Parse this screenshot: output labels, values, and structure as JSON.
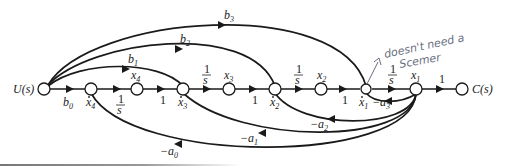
{
  "figure": {
    "type": "signal-flow-graph",
    "input_label": "U(s)",
    "output_label": "C(s)",
    "nodes": [
      {
        "id": "U",
        "label": "U(s)"
      },
      {
        "id": "x4dot",
        "label": "ẋ4"
      },
      {
        "id": "x4",
        "label": "x4"
      },
      {
        "id": "x3dot",
        "label": "ẋ3"
      },
      {
        "id": "x3",
        "label": "x3"
      },
      {
        "id": "x2dot",
        "label": "ẋ2"
      },
      {
        "id": "x2",
        "label": "x2"
      },
      {
        "id": "x1dot",
        "label": "ẋ1"
      },
      {
        "id": "x1",
        "label": "x1"
      },
      {
        "id": "C",
        "label": "C(s)"
      }
    ],
    "forward_gains": {
      "b0": "b",
      "b0_sub": "0",
      "b1": "b",
      "b1_sub": "1",
      "b2": "b",
      "b2_sub": "2",
      "b3": "b",
      "b3_sub": "3",
      "one": "1",
      "integrator_num": "1",
      "integrator_den": "s"
    },
    "feedback_gains": {
      "a0": "−a",
      "a0_sub": "0",
      "a1": "−a",
      "a1_sub": "1",
      "a2": "−a",
      "a2_sub": "2",
      "a3": "−a",
      "a3_sub": "3"
    },
    "node_labels": {
      "x": "x",
      "x4_sub": "4",
      "x3_sub": "3",
      "x2_sub": "2",
      "x1_sub": "1",
      "dot": "·"
    },
    "annotation": {
      "line1": "doesn't need a",
      "line2": "Scemer"
    }
  }
}
